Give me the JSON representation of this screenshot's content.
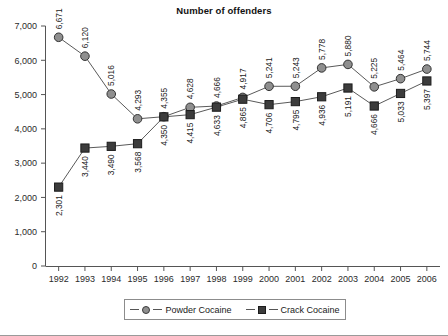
{
  "chart_data": {
    "type": "line",
    "title": "Number of offenders",
    "xlabel": "",
    "ylabel": "",
    "categories": [
      "1992",
      "1993",
      "1994",
      "1995",
      "1996",
      "1997",
      "1998",
      "1999",
      "2000",
      "2001",
      "2002",
      "2003",
      "2004",
      "2005",
      "2006"
    ],
    "series": [
      {
        "name": "Powder Cocaine",
        "marker": "circle",
        "color": "#8f8f8f",
        "values": [
          6671,
          6120,
          5016,
          4293,
          4355,
          4628,
          4666,
          4917,
          5241,
          5243,
          5778,
          5880,
          5225,
          5464,
          5744
        ]
      },
      {
        "name": "Crack Cocaine",
        "marker": "square",
        "color": "#3c3c3c",
        "values": [
          2301,
          3440,
          3490,
          3568,
          4350,
          4415,
          4633,
          4865,
          4706,
          4795,
          4936,
          5191,
          4666,
          5033,
          5397
        ]
      }
    ],
    "yticks": [
      "0",
      "1,000",
      "2,000",
      "3,000",
      "4,000",
      "5,000",
      "6,000",
      "7,000"
    ],
    "ytick_values": [
      0,
      1000,
      2000,
      3000,
      4000,
      5000,
      6000,
      7000
    ],
    "ylim": [
      0,
      7000
    ],
    "grid": false,
    "legend_position": "bottom",
    "value_labels": {
      "powder": [
        "6,671",
        "6,120",
        "5,016",
        "4,293",
        "4,355",
        "4,628",
        "4,666",
        "4,917",
        "5,241",
        "5,243",
        "5,778",
        "5,880",
        "5,225",
        "5,464",
        "5,744"
      ],
      "crack": [
        "2,301",
        "3,440",
        "3,490",
        "3,568",
        "4,350",
        "4,415",
        "4,633",
        "4,865",
        "4,706",
        "4,795",
        "4,936",
        "5,191",
        "4,666",
        "5,033",
        "5,397"
      ]
    }
  },
  "legend": {
    "items": [
      {
        "label": "Powder Cocaine",
        "marker": "circle-marker-icon"
      },
      {
        "label": "Crack Cocaine",
        "marker": "square-marker-icon"
      }
    ]
  }
}
